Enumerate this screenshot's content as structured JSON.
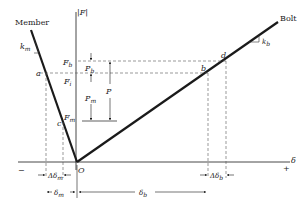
{
  "diagram": {
    "title_labels": {
      "member": "Member",
      "bolt": "Bolt",
      "force_axis": "|F|",
      "deflection_axis": "δ",
      "minus": "−",
      "plus": "+",
      "origin": "O"
    },
    "stiffness": {
      "member": {
        "symbol": "k",
        "subscript": "m"
      },
      "bolt": {
        "symbol": "k",
        "subscript": "b"
      }
    },
    "points": {
      "a": "a",
      "b": "b",
      "c": "c",
      "d": "d"
    },
    "force_levels": {
      "Fb": {
        "symbol": "F",
        "subscript": "b"
      },
      "Fi": {
        "symbol": "F",
        "subscript": "i"
      },
      "Fm": {
        "symbol": "F",
        "subscript": "m"
      }
    },
    "load_arrows": {
      "Pb": {
        "symbol": "P",
        "subscript": "b"
      },
      "Pm": {
        "symbol": "P",
        "subscript": "m"
      },
      "P": {
        "symbol": "P",
        "subscript": ""
      }
    },
    "deflections": {
      "delta_m": {
        "symbol": "δ",
        "subscript": "m"
      },
      "delta_delta_m": {
        "prefix": "Δ",
        "symbol": "δ",
        "subscript": "m"
      },
      "delta_b": {
        "symbol": "δ",
        "subscript": "b"
      },
      "delta_delta_b": {
        "prefix": "Δ",
        "symbol": "δ",
        "subscript": "b"
      }
    },
    "colors": {
      "line": "#1a1a1a",
      "dashed": "#555555",
      "background": "#ffffff"
    }
  }
}
